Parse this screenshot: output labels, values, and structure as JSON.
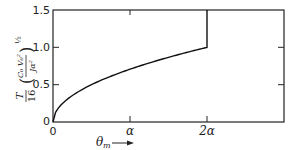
{
  "chart_data": {
    "type": "line",
    "title": "",
    "xlabel": "θm →",
    "ylabel": "T/16 (C0 V0^2 / J α^2)^(1/2)",
    "x_tick_labels": [
      "0",
      "α",
      "2α"
    ],
    "y_tick_labels": [
      "0",
      "0.5",
      "1.0",
      "1.5"
    ],
    "xlim": [
      0,
      "3α"
    ],
    "ylim": [
      0,
      1.5
    ],
    "grid": false,
    "legend": null,
    "series": [
      {
        "name": "curve",
        "description": "square-root rise from 0 to 1.0 at 2α, then vertical jump to 1.5",
        "x": [
          0,
          0.1,
          0.25,
          0.5,
          0.75,
          1.0,
          1.25,
          1.5,
          1.75,
          2.0,
          2.0
        ],
        "x_units": "α",
        "values": [
          0,
          0.22,
          0.35,
          0.5,
          0.61,
          0.71,
          0.79,
          0.87,
          0.94,
          1.0,
          1.5
        ]
      }
    ]
  },
  "axis": {
    "x_ticks": [
      "0",
      "α",
      "2α"
    ],
    "y_ticks": [
      "0",
      "0.5",
      "1.0",
      "1.5"
    ],
    "x_label_main": "θ",
    "x_label_sub": "m",
    "x_arrow": "→",
    "y_label": {
      "prefix_num": "T",
      "prefix_den": "16",
      "inner_num": "C₀ V₀²",
      "inner_den": "Jα²",
      "exponent": "½"
    }
  }
}
